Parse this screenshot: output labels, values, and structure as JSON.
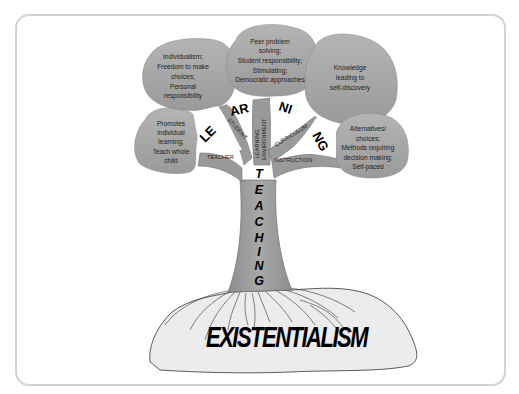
{
  "diagram": {
    "roots_label": "EXISTENTIALISM",
    "trunk_label": "TEACHING",
    "trunk_letters": [
      "T",
      "E",
      "A",
      "C",
      "H",
      "I",
      "N",
      "G"
    ],
    "canopy_word": "LEARNING",
    "canopy_fragments": [
      "LE",
      "AR",
      "NI",
      "NG"
    ],
    "branches": {
      "teacher": "TEACHER",
      "student": "STUDENT",
      "learning_environment_line1": "LEARNING",
      "learning_environment_line2": "ENVIRONMENT",
      "curriculum": "CURRICULUM",
      "instruction": "INSTRUCTION"
    },
    "leaves": {
      "teacher": [
        "Promotes",
        "individual",
        "learning;",
        "Teach whole",
        "child"
      ],
      "student": [
        "Individualism;",
        "Freedom to make",
        "choices;",
        "Personal",
        "responsibility"
      ],
      "learning_environment": [
        "Peer problem",
        "solving;",
        "Student responsibility;",
        "Stimulating;",
        "Democratic approaches"
      ],
      "curriculum": [
        "Knowledge",
        "leading to",
        "self-discovery"
      ],
      "instruction": [
        "Alternatives/",
        "choices;",
        "Methods requiring",
        "decision making;",
        "Self-paced"
      ]
    },
    "colors": {
      "foliage": "#a6a6a6",
      "foliage_stroke": "#8a8a8a",
      "trunk": "#9a9a9a",
      "ground": "#ececec",
      "frame": "#d2d2d2"
    }
  }
}
